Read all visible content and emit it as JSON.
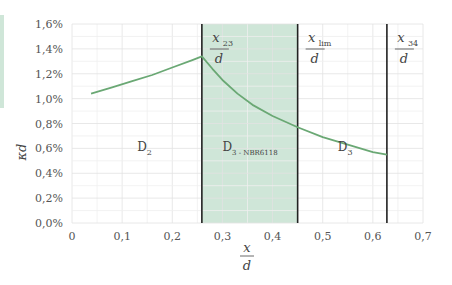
{
  "chart_data": {
    "type": "line",
    "title": "",
    "xlabel": "x/d",
    "ylabel": "κd",
    "xlim": [
      0,
      0.7
    ],
    "ylim": [
      0,
      1.6
    ],
    "x_ticks": [
      "0",
      "0,1",
      "0,2",
      "0,3",
      "0,4",
      "0,5",
      "0,6",
      "0,7"
    ],
    "y_ticks": [
      "0,0%",
      "0,2%",
      "0,4%",
      "0,6%",
      "0,8%",
      "1,0%",
      "1,2%",
      "1,4%",
      "1,6%"
    ],
    "grid": true,
    "series": [
      {
        "name": "κd",
        "color": "#6aa874",
        "x": [
          0.038,
          0.08,
          0.12,
          0.16,
          0.2,
          0.24,
          0.259,
          0.28,
          0.3,
          0.33,
          0.36,
          0.4,
          0.45,
          0.5,
          0.55,
          0.6,
          0.628
        ],
        "y": [
          1.04,
          1.09,
          1.14,
          1.19,
          1.25,
          1.31,
          1.34,
          1.24,
          1.15,
          1.04,
          0.95,
          0.86,
          0.77,
          0.69,
          0.63,
          0.57,
          0.55
        ]
      }
    ],
    "vertical_lines": [
      {
        "x": 0.259,
        "label_num": "x",
        "label_sub": "23",
        "label_den": "d"
      },
      {
        "x": 0.45,
        "label_num": "x",
        "label_sub": "lim",
        "label_den": "d"
      },
      {
        "x": 0.628,
        "label_num": "x",
        "label_sub": "34",
        "label_den": "d"
      }
    ],
    "shaded_region": {
      "x0": 0.259,
      "x1": 0.45,
      "color": "#cfe6d8"
    },
    "annotations": [
      {
        "text": "D",
        "sub": "2",
        "x": 0.13,
        "y": 0.58
      },
      {
        "text": "D",
        "sub": "3 - NBR6118",
        "x": 0.3,
        "y": 0.58
      },
      {
        "text": "D",
        "sub": "3",
        "x": 0.53,
        "y": 0.58
      }
    ]
  },
  "labels": {
    "ylabel": "κd",
    "xlabel_num": "x",
    "xlabel_den": "d"
  }
}
